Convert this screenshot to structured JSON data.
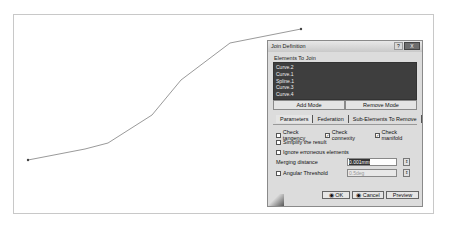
{
  "viewport": {
    "curve_points": [
      [
        27,
        159
      ],
      [
        84,
        148
      ],
      [
        107,
        142
      ],
      [
        151,
        114
      ],
      [
        180,
        79
      ],
      [
        229,
        42
      ],
      [
        300,
        28
      ]
    ]
  },
  "dialog": {
    "title": "Join Definition",
    "help_label": "?",
    "close_label": "X",
    "elements_group_label": "Elements To Join",
    "elements": [
      "Curve.2",
      "Curve.1",
      "Spline.1",
      "Curve.3",
      "Curve.4"
    ],
    "add_mode_label": "Add Mode",
    "remove_mode_label": "Remove Mode",
    "tabs": [
      "Parameters",
      "Federation",
      "Sub-Elements To Remove"
    ],
    "active_tab": "Parameters",
    "check_tangency_label": "Check tangency",
    "check_tangency_checked": false,
    "check_connexity_label": "Check connexity",
    "check_connexity_checked": true,
    "check_manifold_label": "Check manifold",
    "check_manifold_checked": true,
    "simplify_label": "Simplify the result",
    "simplify_checked": false,
    "ignore_label": "Ignore erroneous elements",
    "ignore_checked": false,
    "merging_distance_label": "Merging distance",
    "merging_distance_value": "0.001mm",
    "angular_threshold_label": "Angular Threshold",
    "angular_threshold_checked": false,
    "angular_threshold_value": "0.5deg",
    "ok_label": "OK",
    "cancel_label": "Cancel",
    "preview_label": "Preview"
  }
}
